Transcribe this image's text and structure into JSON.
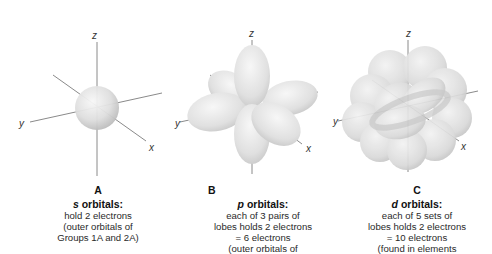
{
  "panels": [
    {
      "id": "A",
      "letter": "A",
      "orbital_symbol": "s",
      "title_suffix": " orbitals:",
      "lines": [
        "hold 2 electrons",
        "(outer orbitals of",
        "Groups 1A and 2A)"
      ],
      "axes": {
        "x": "x",
        "y": "y",
        "z": "z"
      }
    },
    {
      "id": "B",
      "letter": "B",
      "orbital_symbol": "p",
      "title_suffix": " orbitals:",
      "lines": [
        "each of 3 pairs of",
        "lobes holds 2 electrons",
        "= 6 electrons",
        "(outer orbitals of"
      ],
      "axes": {
        "x": "x",
        "y": "y",
        "z": "z"
      }
    },
    {
      "id": "C",
      "letter": "C",
      "orbital_symbol": "d",
      "title_suffix": " orbitals:",
      "lines": [
        "each of 5 sets of",
        "lobes holds 2 electrons",
        "= 10 electrons",
        "(found in  elements"
      ],
      "axes": {
        "x": "x",
        "y": "y",
        "z": "z"
      }
    }
  ],
  "colors": {
    "orbital_light": "#f4f4f4",
    "orbital_mid": "#d9d9d9",
    "orbital_dark": "#b5b5b5",
    "axis": "#8a8a8a"
  }
}
